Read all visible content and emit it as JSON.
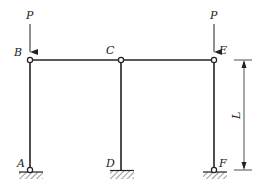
{
  "diagram": {
    "type": "structural-frame",
    "nodes": {
      "B": {
        "label": "B",
        "x": 30,
        "y": 60,
        "kind": "hinge"
      },
      "C": {
        "label": "C",
        "x": 121,
        "y": 60,
        "kind": "hinge"
      },
      "E": {
        "label": "E",
        "x": 214,
        "y": 60,
        "kind": "hinge"
      },
      "A": {
        "label": "A",
        "x": 30,
        "y": 170,
        "kind": "pinned-support"
      },
      "D": {
        "label": "D",
        "x": 121,
        "y": 170,
        "kind": "fixed-support"
      },
      "F": {
        "label": "F",
        "x": 214,
        "y": 170,
        "kind": "pinned-support"
      }
    },
    "loads": [
      {
        "label": "P",
        "at": "B",
        "direction": "down"
      },
      {
        "label": "P",
        "at": "E",
        "direction": "down"
      }
    ],
    "dimension": {
      "label": "L",
      "from": "E",
      "to": "F"
    },
    "colors": {
      "line": "#222222",
      "background": "#ffffff"
    }
  }
}
